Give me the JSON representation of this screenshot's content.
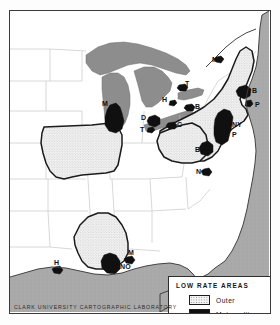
{
  "figure": {
    "credit": "CLARK UNIVERSITY CARTOGRAPHIC LABORATORY"
  },
  "legend": {
    "title": "LOW RATE AREAS",
    "entries": [
      {
        "key": "outer",
        "label": "Outer",
        "color": "#f4f4f4"
      },
      {
        "key": "metropolitan",
        "label": "Metropolitan",
        "color": "#101010"
      }
    ]
  },
  "colors": {
    "ocean": "#a8a8a8",
    "lake": "#8f8f8f",
    "land": "#ffffff",
    "outer_fill": "#f2f2f2",
    "metro_fill": "#101010",
    "state_line": "#b4b4b4",
    "outer_outline": "#1b1b1b",
    "frame": "#3a3a3a"
  },
  "map": {
    "city_labels": [
      {
        "id": "montreal",
        "text": "M",
        "x": 202,
        "y": 45
      },
      {
        "id": "toronto",
        "text": "T",
        "x": 175,
        "y": 75
      },
      {
        "id": "hamilton",
        "text": "H",
        "x": 160,
        "y": 88
      },
      {
        "id": "buffalo",
        "text": "B",
        "x": 181,
        "y": 97
      },
      {
        "id": "boston",
        "text": "B",
        "x": 241,
        "y": 86
      },
      {
        "id": "providence",
        "text": "P",
        "x": 245,
        "y": 96
      },
      {
        "id": "milwaukee",
        "text": "M",
        "x": 99,
        "y": 95
      },
      {
        "id": "chicago",
        "text": "C",
        "x": 110,
        "y": 112
      },
      {
        "id": "detroit",
        "text": "D",
        "x": 137,
        "y": 108
      },
      {
        "id": "toledo",
        "text": "T",
        "x": 136,
        "y": 119
      },
      {
        "id": "cleveland",
        "text": "C",
        "x": 166,
        "y": 114
      },
      {
        "id": "new-york",
        "text": "NY",
        "x": 219,
        "y": 114
      },
      {
        "id": "philadelphia",
        "text": "P",
        "x": 220,
        "y": 124
      },
      {
        "id": "baltimore",
        "text": "B",
        "x": 198,
        "y": 141
      },
      {
        "id": "norfolk",
        "text": "N",
        "x": 198,
        "y": 161
      },
      {
        "id": "houston",
        "text": "H",
        "x": 48,
        "y": 253
      },
      {
        "id": "new-orleans",
        "text": "NO",
        "x": 106,
        "y": 256
      },
      {
        "id": "mobile",
        "text": "M",
        "x": 119,
        "y": 243
      }
    ]
  }
}
